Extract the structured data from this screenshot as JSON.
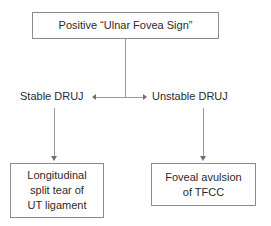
{
  "diagram": {
    "colors": {
      "background": "#ffffff",
      "box_border": "#8c8c8c",
      "connector": "#9a9a9a",
      "arrowhead": "#6f6f6f",
      "text": "#2b2b2b"
    },
    "root_node": {
      "label": "Positive “Ulnar Fovea Sign”"
    },
    "branches": [
      {
        "label": "Stable DRUJ",
        "outcome": "Longitudinal\nsplit tear of\nUT ligament"
      },
      {
        "label": "Unstable DRUJ",
        "outcome": "Foveal avulsion\nof TFCC"
      }
    ]
  }
}
